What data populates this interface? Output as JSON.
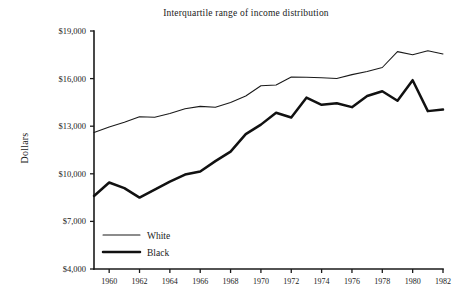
{
  "chart_data": {
    "type": "line",
    "title": "Interquartile range of income distribution",
    "xlabel": "",
    "ylabel": "Dollars",
    "xlim": [
      1959,
      1982
    ],
    "ylim": [
      4000,
      19000
    ],
    "grid": false,
    "legend_position": "bottom-left",
    "y_ticks": [
      4000,
      7000,
      10000,
      13000,
      16000,
      19000
    ],
    "y_tick_labels": [
      "$4,000",
      "$7,000",
      "$10,000",
      "$13,000",
      "$16,000",
      "$19,000"
    ],
    "x_ticks": [
      1960,
      1962,
      1964,
      1966,
      1968,
      1970,
      1972,
      1974,
      1976,
      1978,
      1980,
      1982
    ],
    "x_tick_labels": [
      "1960",
      "1962",
      "1964",
      "1966",
      "1968",
      "1970",
      "1972",
      "1974",
      "1976",
      "1978",
      "1980",
      "1982"
    ],
    "x": [
      1959,
      1960,
      1961,
      1962,
      1963,
      1964,
      1965,
      1966,
      1967,
      1968,
      1969,
      1970,
      1971,
      1972,
      1973,
      1974,
      1975,
      1976,
      1977,
      1978,
      1979,
      1980,
      1981,
      1982
    ],
    "series": [
      {
        "name": "White",
        "style": "thin",
        "values": [
          12600,
          12950,
          13250,
          13600,
          13570,
          13800,
          14100,
          14250,
          14200,
          14500,
          14900,
          15550,
          15600,
          16100,
          16080,
          16050,
          16000,
          16250,
          16450,
          16700,
          17700,
          17500,
          17750,
          17550
        ]
      },
      {
        "name": "Black",
        "style": "thick",
        "values": [
          8600,
          9450,
          9100,
          8500,
          9000,
          9500,
          9950,
          10150,
          10800,
          11400,
          12500,
          13100,
          13850,
          13550,
          14800,
          14350,
          14450,
          14200,
          14900,
          15200,
          14600,
          15900,
          13950,
          14050
        ]
      }
    ],
    "legend": [
      {
        "label": "White",
        "style": "thin"
      },
      {
        "label": "Black",
        "style": "thick"
      }
    ]
  },
  "geometry": {
    "plot_left": 94,
    "plot_right": 443,
    "plot_top": 31,
    "plot_bottom": 269,
    "title_x": 246,
    "title_y": 16,
    "ylabel_x": 28,
    "ylabel_y": 148,
    "legend_x_line_start": 103,
    "legend_x_line_end": 140,
    "legend_x_text": 147,
    "legend_y_first": 235,
    "legend_y_step": 17
  }
}
